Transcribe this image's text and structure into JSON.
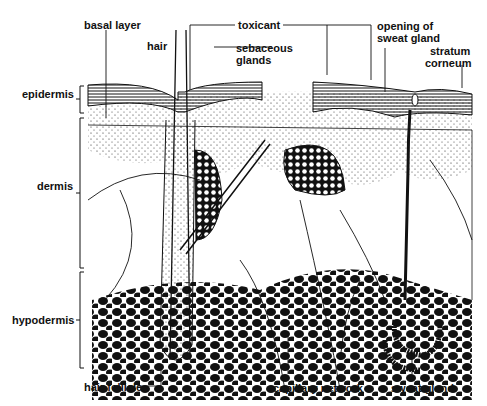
{
  "diagram": {
    "labels": {
      "basal_layer": "basal layer",
      "toxicant": "toxicant",
      "opening_sweat_gland_1": "opening of",
      "opening_sweat_gland_2": "sweat gland",
      "hair": "hair",
      "sebaceous_1": "sebaceous",
      "sebaceous_2": "glands",
      "stratum_1": "stratum",
      "stratum_2": "corneum",
      "epidermis": "epidermis",
      "dermis": "dermis",
      "hypodermis": "hypodermis",
      "hair_follicle": "hair follicle",
      "capillary_network": "capillary network",
      "sweat_gland": "sweat gland"
    },
    "colors": {
      "ink": "#111111",
      "background": "#ffffff"
    }
  }
}
